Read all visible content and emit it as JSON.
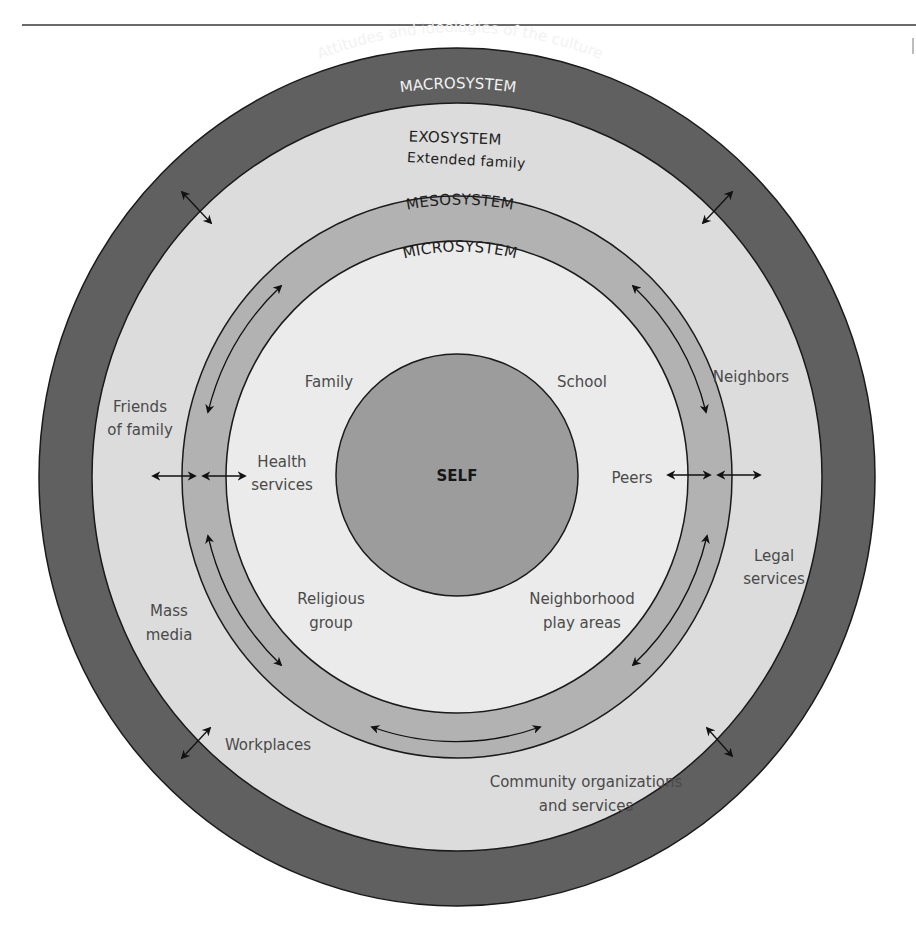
{
  "diagram": {
    "type": "concentric-systems",
    "colors": {
      "macro_ring": "#606060",
      "exo_area": "#dcdcdc",
      "meso_ring": "#b2b2b2",
      "micro_area": "#ebebeb",
      "self_circle": "#9c9c9c",
      "outline": "#1a1a1a",
      "label_text": "#4a4a4a"
    },
    "macrosystem": {
      "title": "MACROSYSTEM",
      "subtitle": "Attitudes and ideologies of the culture"
    },
    "exosystem": {
      "title": "EXOSYSTEM",
      "subtitle": "Extended family",
      "items": {
        "neighbors": "Neighbors",
        "friends_of_family_1": "Friends",
        "friends_of_family_2": "of family",
        "legal_services_1": "Legal",
        "legal_services_2": "services",
        "mass_media_1": "Mass",
        "mass_media_2": "media",
        "workplaces": "Workplaces",
        "community_1": "Community organizations",
        "community_2": "and services"
      }
    },
    "mesosystem": {
      "title": "MESOSYSTEM"
    },
    "microsystem": {
      "title": "MICROSYSTEM",
      "items": {
        "family": "Family",
        "school": "School",
        "health_1": "Health",
        "health_2": "services",
        "peers": "Peers",
        "religious_1": "Religious",
        "religious_2": "group",
        "neighborhood_1": "Neighborhood",
        "neighborhood_2": "play areas"
      }
    },
    "self": {
      "label": "SELF"
    }
  }
}
